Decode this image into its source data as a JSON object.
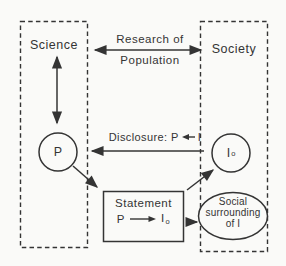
{
  "colors": {
    "background": "#fafaf8",
    "ink": "#343434"
  },
  "boxes": {
    "science": {
      "label": "Science"
    },
    "society": {
      "label": "Society"
    }
  },
  "arrows": {
    "research": {
      "line1": "Research of",
      "line2": "Population"
    },
    "disclosure": {
      "prefix": "Disclosure: P",
      "suffix": "I"
    }
  },
  "nodes": {
    "p_circle": {
      "label": "P"
    },
    "i_circle": {
      "label": "I",
      "sub": "o"
    },
    "statement": {
      "title": "Statement",
      "from": "P",
      "to": "I",
      "to_sub": "o"
    },
    "social": {
      "lines": [
        "Social",
        "surrounding",
        "of I"
      ]
    }
  }
}
